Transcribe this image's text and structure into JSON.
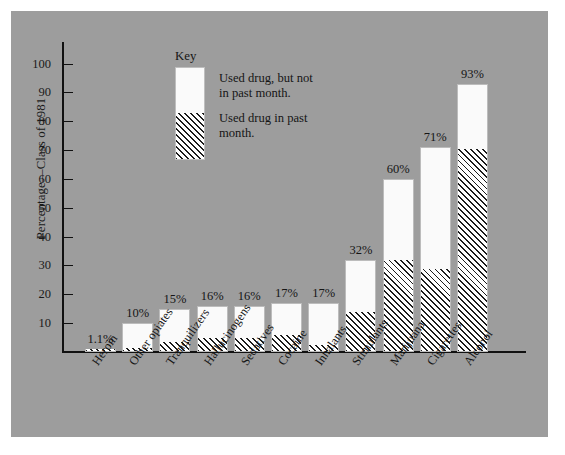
{
  "chart_data": {
    "type": "bar",
    "title": "",
    "subtitle": "",
    "xlabel": "",
    "ylabel": "Percentage—Class of 1981",
    "ylim": [
      0,
      100
    ],
    "ytick_step": 10,
    "grid": false,
    "stacked": true,
    "legend_position": "inside-top-left",
    "legend_title": "Key",
    "categories": [
      "Heroin",
      "Other opiates",
      "Tranquilizers",
      "Hallucinogens",
      "Sedatives",
      "Cocaine",
      "Inhalants",
      "Stimulants",
      "Marijuana",
      "Cigarettes",
      "Alcohol"
    ],
    "yticks": [
      10,
      20,
      30,
      40,
      50,
      60,
      70,
      80,
      90,
      100
    ],
    "ytick_labels": [
      "10",
      "20",
      "30",
      "40",
      "50",
      "60",
      "70",
      "80",
      "90",
      "100"
    ],
    "series": [
      {
        "name": "Used drug in past month.",
        "pattern": "diagonal-hatch",
        "values": [
          0.5,
          1.0,
          3.0,
          4.5,
          4.5,
          5.5,
          2.0,
          13.5,
          31.5,
          28.5,
          70.0
        ]
      },
      {
        "name": "Used drug, but not in past month.",
        "pattern": "solid-white",
        "values": [
          0.6,
          9.0,
          12.0,
          11.5,
          11.5,
          11.5,
          15.0,
          18.5,
          28.5,
          42.5,
          23.0
        ]
      }
    ],
    "totals": [
      1.1,
      10,
      15,
      16,
      16,
      17,
      17,
      32,
      60,
      71,
      93
    ],
    "value_labels": [
      "1.1%",
      "10%",
      "15%",
      "16%",
      "16%",
      "17%",
      "17%",
      "32%",
      "60%",
      "71%",
      "93%"
    ],
    "legend": [
      {
        "label_line1": "Used drug, but not",
        "label_line2": "in past month.",
        "pattern": "solid-white"
      },
      {
        "label_line1": "Used drug in past",
        "label_line2": "month.",
        "pattern": "diagonal-hatch"
      }
    ],
    "colors": {
      "panel_background": "#9d9d9d",
      "bar_fill": "#fafafa",
      "hatch_line": "#1c1c1c",
      "axis": "#111111",
      "text": "#151515"
    }
  }
}
